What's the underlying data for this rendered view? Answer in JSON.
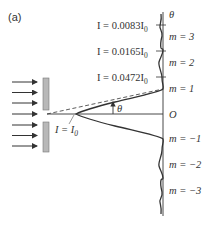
{
  "figure": {
    "panel_label": "(a)",
    "axis_label_top": "θ",
    "origin_label": "O",
    "angle_label": "θ",
    "central_intensity_label": {
      "prefix": "I = I",
      "subscript": "0"
    },
    "orders": [
      {
        "m": "m = 3"
      },
      {
        "m": "m = 2"
      },
      {
        "m": "m = 1"
      },
      {
        "m": "m = −1"
      },
      {
        "m": "m = −2"
      },
      {
        "m": "m = −3"
      }
    ],
    "maxima_intensities": [
      {
        "text": "I = 0.0083I",
        "subscript": "0",
        "value": 0.0083
      },
      {
        "text": "I = 0.0165I",
        "subscript": "0",
        "value": 0.0165
      },
      {
        "text": "I = 0.0472I",
        "subscript": "0",
        "value": 0.0472
      }
    ],
    "incident_arrows": 7,
    "colors": {
      "lines": "#333333",
      "slit": "#b8b8b8",
      "curve": "#333333"
    }
  }
}
